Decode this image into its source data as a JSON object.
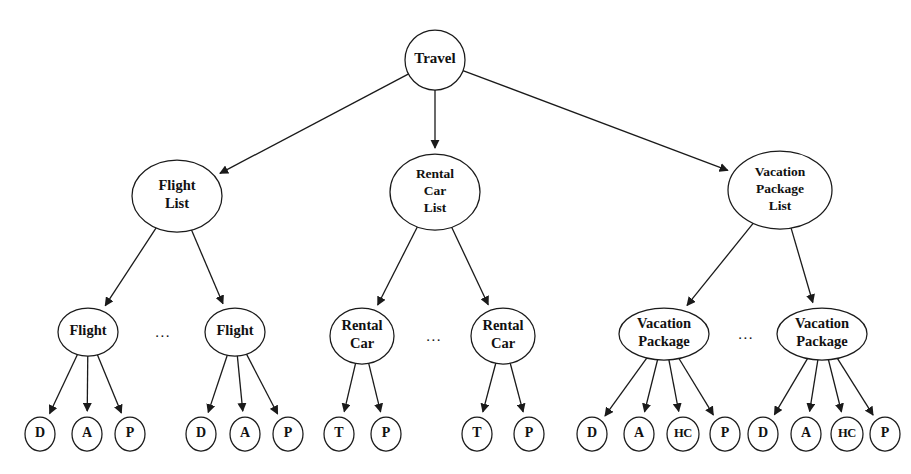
{
  "diagram": {
    "type": "tree",
    "background_color": "#ffffff",
    "stroke_color": "#1a1a1a",
    "text_color": "#111111",
    "ellipsis_text": "...",
    "root": {
      "id": "travel",
      "label": "Travel",
      "shape": "circle",
      "cx": 435,
      "cy": 60,
      "rx": 30,
      "ry": 29,
      "lines": [
        "Travel"
      ]
    },
    "level2": [
      {
        "id": "flight-list",
        "label": "Flight List",
        "shape": "ellipse",
        "cx": 177,
        "cy": 196,
        "rx": 45,
        "ry": 36,
        "lines": [
          "Flight",
          "List"
        ]
      },
      {
        "id": "rental-car-list",
        "label": "Rental Car List",
        "shape": "ellipse",
        "cx": 435,
        "cy": 192,
        "rx": 45,
        "ry": 38,
        "lines": [
          "Rental",
          "Car",
          "List"
        ]
      },
      {
        "id": "vacation-package-list",
        "label": "Vacation Package List",
        "shape": "ellipse",
        "cx": 780,
        "cy": 190,
        "rx": 52,
        "ry": 39,
        "lines": [
          "Vacation",
          "Package",
          "List"
        ]
      }
    ],
    "level3": [
      {
        "id": "flight-1",
        "parent": "flight-list",
        "label": "Flight",
        "shape": "ellipse",
        "cx": 88,
        "cy": 332,
        "rx": 30,
        "ry": 24,
        "lines": [
          "Flight"
        ]
      },
      {
        "id": "flight-2",
        "parent": "flight-list",
        "label": "Flight",
        "shape": "ellipse",
        "cx": 235,
        "cy": 332,
        "rx": 30,
        "ry": 24,
        "lines": [
          "Flight"
        ]
      },
      {
        "id": "rental-car-1",
        "parent": "rental-car-list",
        "label": "Rental Car",
        "shape": "ellipse",
        "cx": 362,
        "cy": 336,
        "rx": 32,
        "ry": 28,
        "lines": [
          "Rental",
          "Car"
        ]
      },
      {
        "id": "rental-car-2",
        "parent": "rental-car-list",
        "label": "Rental Car",
        "shape": "ellipse",
        "cx": 503,
        "cy": 336,
        "rx": 32,
        "ry": 28,
        "lines": [
          "Rental",
          "Car"
        ]
      },
      {
        "id": "vacation-package-1",
        "parent": "vacation-package-list",
        "label": "Vacation Package",
        "shape": "ellipse",
        "cx": 664,
        "cy": 334,
        "rx": 45,
        "ry": 26,
        "lines": [
          "Vacation",
          "Package"
        ]
      },
      {
        "id": "vacation-package-2",
        "parent": "vacation-package-list",
        "label": "Vacation Package",
        "shape": "ellipse",
        "cx": 822,
        "cy": 334,
        "rx": 45,
        "ry": 26,
        "lines": [
          "Vacation",
          "Package"
        ]
      }
    ],
    "leaves": [
      {
        "id": "flight-1-d",
        "parent": "flight-1",
        "label": "D",
        "cx": 40,
        "cy": 434,
        "rx": 15,
        "ry": 17,
        "narrow": false
      },
      {
        "id": "flight-1-a",
        "parent": "flight-1",
        "label": "A",
        "cx": 87,
        "cy": 434,
        "rx": 15,
        "ry": 17,
        "narrow": false
      },
      {
        "id": "flight-1-p",
        "parent": "flight-1",
        "label": "P",
        "cx": 130,
        "cy": 434,
        "rx": 15,
        "ry": 17,
        "narrow": false
      },
      {
        "id": "flight-2-d",
        "parent": "flight-2",
        "label": "D",
        "cx": 201,
        "cy": 434,
        "rx": 15,
        "ry": 17,
        "narrow": false
      },
      {
        "id": "flight-2-a",
        "parent": "flight-2",
        "label": "A",
        "cx": 245,
        "cy": 434,
        "rx": 15,
        "ry": 17,
        "narrow": false
      },
      {
        "id": "flight-2-p",
        "parent": "flight-2",
        "label": "P",
        "cx": 288,
        "cy": 434,
        "rx": 15,
        "ry": 17,
        "narrow": false
      },
      {
        "id": "rental-car-1-t",
        "parent": "rental-car-1",
        "label": "T",
        "cx": 339,
        "cy": 434,
        "rx": 15,
        "ry": 17,
        "narrow": false
      },
      {
        "id": "rental-car-1-p",
        "parent": "rental-car-1",
        "label": "P",
        "cx": 386,
        "cy": 434,
        "rx": 15,
        "ry": 17,
        "narrow": false
      },
      {
        "id": "rental-car-2-t",
        "parent": "rental-car-2",
        "label": "T",
        "cx": 477,
        "cy": 434,
        "rx": 15,
        "ry": 17,
        "narrow": false
      },
      {
        "id": "rental-car-2-p",
        "parent": "rental-car-2",
        "label": "P",
        "cx": 529,
        "cy": 434,
        "rx": 15,
        "ry": 17,
        "narrow": false
      },
      {
        "id": "vacation-package-1-d",
        "parent": "vacation-package-1",
        "label": "D",
        "cx": 592,
        "cy": 434,
        "rx": 15,
        "ry": 17,
        "narrow": false
      },
      {
        "id": "vacation-package-1-a",
        "parent": "vacation-package-1",
        "label": "A",
        "cx": 639,
        "cy": 434,
        "rx": 15,
        "ry": 17,
        "narrow": false
      },
      {
        "id": "vacation-package-1-hc",
        "parent": "vacation-package-1",
        "label": "HC",
        "cx": 683,
        "cy": 434,
        "rx": 16,
        "ry": 17,
        "narrow": true
      },
      {
        "id": "vacation-package-1-p",
        "parent": "vacation-package-1",
        "label": "P",
        "cx": 725,
        "cy": 434,
        "rx": 15,
        "ry": 17,
        "narrow": false
      },
      {
        "id": "vacation-package-2-d",
        "parent": "vacation-package-2",
        "label": "D",
        "cx": 763,
        "cy": 434,
        "rx": 15,
        "ry": 17,
        "narrow": false
      },
      {
        "id": "vacation-package-2-a",
        "parent": "vacation-package-2",
        "label": "A",
        "cx": 806,
        "cy": 434,
        "rx": 15,
        "ry": 17,
        "narrow": false
      },
      {
        "id": "vacation-package-2-hc",
        "parent": "vacation-package-2",
        "label": "HC",
        "cx": 847,
        "cy": 434,
        "rx": 16,
        "ry": 17,
        "narrow": true
      },
      {
        "id": "vacation-package-2-p",
        "parent": "vacation-package-2",
        "label": "P",
        "cx": 885,
        "cy": 434,
        "rx": 15,
        "ry": 17,
        "narrow": false
      }
    ],
    "ellipses_markers": [
      {
        "id": "ellipsis-flight",
        "x": 163,
        "y": 334
      },
      {
        "id": "ellipsis-rental-car",
        "x": 434,
        "y": 338
      },
      {
        "id": "ellipsis-vacation-package",
        "x": 746,
        "y": 336
      }
    ]
  }
}
